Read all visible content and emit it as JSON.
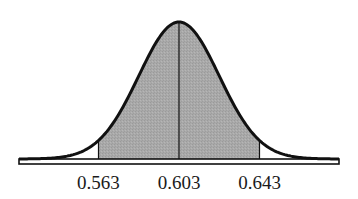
{
  "chart_data": {
    "type": "area",
    "title": "",
    "xlabel": "",
    "ylabel": "",
    "distribution": "normal",
    "mean": 0.603,
    "std_dev": 0.02,
    "shaded_interval": [
      0.563,
      0.643
    ],
    "x_ticks": [
      0.563,
      0.603,
      0.643
    ],
    "tick_labels": [
      "0.563",
      "0.603",
      "0.643"
    ],
    "xlim": [
      0.5235,
      0.6825
    ],
    "grid": false,
    "legend": null,
    "annotations": [
      "vertical line at mean 0.603",
      "shaded area between 0.563 and 0.643"
    ]
  },
  "colors": {
    "curve": "#111111",
    "shade": "#a8a8a8",
    "background": "#ffffff"
  }
}
